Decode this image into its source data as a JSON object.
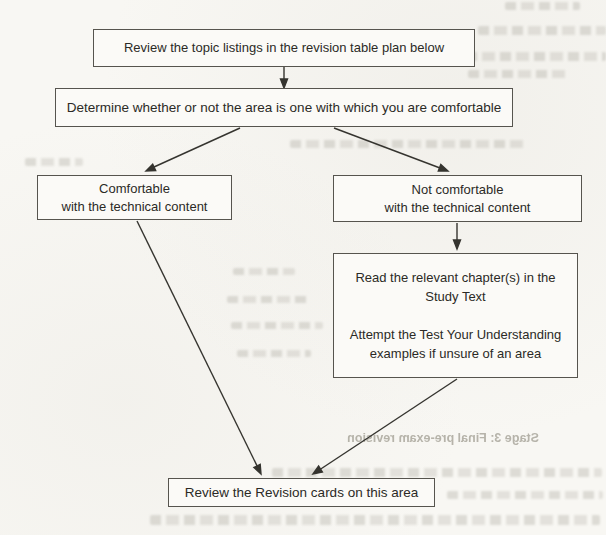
{
  "colors": {
    "paper": "#f8f7f3",
    "ink": "#2b2a26",
    "box_border": "#56544e",
    "arrow": "#35342f",
    "bleed_text": "#a6a398"
  },
  "flowchart": {
    "nodes": [
      {
        "id": "review-topic-listings",
        "text": "Review the topic listings in the revision table plan below"
      },
      {
        "id": "determine-comfortable",
        "text": "Determine whether or not the area is one with which you are comfortable"
      },
      {
        "id": "comfortable",
        "lines": [
          "Comfortable",
          "with the technical content"
        ]
      },
      {
        "id": "not-comfortable",
        "lines": [
          "Not comfortable",
          "with the technical content"
        ]
      },
      {
        "id": "read-study-text",
        "lines": [
          "Read the relevant chapter(s) in the",
          "Study Text",
          "",
          "Attempt the Test Your Understanding",
          "examples if unsure of an area"
        ]
      },
      {
        "id": "review-revision-cards",
        "text": "Review the Revision cards on this area"
      }
    ],
    "edges": [
      {
        "from": "review-topic-listings",
        "to": "determine-comfortable"
      },
      {
        "from": "determine-comfortable",
        "to": "comfortable"
      },
      {
        "from": "determine-comfortable",
        "to": "not-comfortable"
      },
      {
        "from": "not-comfortable",
        "to": "read-study-text"
      },
      {
        "from": "comfortable",
        "to": "review-revision-cards"
      },
      {
        "from": "read-study-text",
        "to": "review-revision-cards"
      }
    ]
  },
  "bleed_through_text": {
    "stage_heading": "Stage 3: Final pre-exam revision"
  }
}
